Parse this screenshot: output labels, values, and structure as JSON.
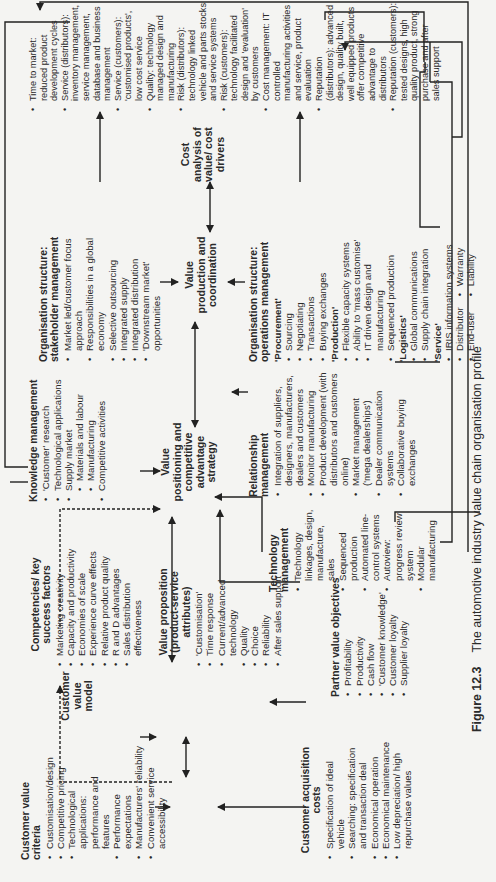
{
  "figure": {
    "number": "Figure 12.3",
    "caption": "The automotive industry value chain organisation profile"
  },
  "customer_value_criteria": {
    "title": "Customer value criteria",
    "items": [
      "Customisation/design",
      "Competitive pricing",
      "Technological applications: performance and features",
      "Performance expectations",
      "Manufacturers' reliability",
      "Convenient service accessibility"
    ]
  },
  "customer_value_model": {
    "label": "Customer value model"
  },
  "customer_acquisition_costs": {
    "title": "Customer acquisition costs",
    "items": [
      "Specification of ideal vehicle",
      "Searching: specification and transaction deal",
      "Economical operation",
      "Economical maintenance",
      "Low depreciation/ high repurchase values"
    ]
  },
  "competencies": {
    "title": "Competencies/ key success factors",
    "items": [
      "Marketing creativity",
      "Capacity and productivity",
      "Economies of scale",
      "Experience curve effects",
      "Relative product quality",
      "R and D advantages",
      "Sales distribution effectiveness"
    ]
  },
  "value_proposition": {
    "title": "Value proposition (product-service attributes)",
    "items": [
      "'Customisation'",
      "Time response",
      "Current/advanced technology",
      "Quality",
      "Choice",
      "Reliability",
      "After sales support"
    ]
  },
  "partner_value_objectives": {
    "title": "Partner value objectives",
    "items": [
      "Profitability",
      "Productivity",
      "Cash flow",
      "'Customer knowledge'",
      "Customer loyalty",
      "Supplier loyalty"
    ]
  },
  "knowledge_management": {
    "title": "Knowledge management",
    "items": [
      {
        "text": "'Customer' research",
        "level": 0
      },
      {
        "text": "Technological applications",
        "level": 0
      },
      {
        "text": "Supply market",
        "level": 0
      },
      {
        "text": "Materials and labour",
        "level": 1
      },
      {
        "text": "Manufacturing",
        "level": 1
      },
      {
        "text": "Competitive activities",
        "level": 0
      }
    ]
  },
  "value_positioning": {
    "label": "Value positioning and competitive advantage strategy"
  },
  "technology_management": {
    "title": "Technology management",
    "items": [
      "Technology linkages, design, manufacture, sales",
      "Sequenced production",
      "Automated line-control systems",
      "Autoview: progress review system",
      "Modular manufacturing"
    ]
  },
  "relationship_management": {
    "title": "Relationship management",
    "items": [
      "Integration of suppliers, designers, manufacturers, dealers and customers",
      "Monitor manufacturing",
      "Product development (with distributors and customers online)",
      "Market management ('mega dealerships')",
      "Dealer communication systems",
      "Collaborative buying exchanges"
    ]
  },
  "stakeholder_management": {
    "title": "Organisation structure: stakeholder management",
    "items": [
      "Market led/customer focus approach",
      "Responsibilities in a global economy",
      "Selective outsourcing",
      "Integrated supply",
      "Integrated distribution",
      "'Downstream market' opportunities"
    ]
  },
  "value_production": {
    "label": "Value production and coordination"
  },
  "operations_management": {
    "title": "Organisation structure: operations management",
    "sections": [
      {
        "heading": "'Procurement'",
        "items": [
          "Sourcing",
          "Negotiating",
          "Transactions",
          "Buying exchanges"
        ]
      },
      {
        "heading": "'Production'",
        "items": [
          "Flexible capacity systems",
          "Ability to 'mass customise'",
          "IT driven design and manufacturing",
          "Sequenced production"
        ]
      },
      {
        "heading": "'Logistics'",
        "items": [
          "Global communications",
          "Supply chain integration"
        ]
      },
      {
        "heading": "'Service'",
        "items": [
          "IRIS information systems"
        ],
        "columns": [
          [
            "Distributor",
            "End-user"
          ],
          [
            "Warranty",
            "Liability"
          ]
        ]
      }
    ]
  },
  "cost_analysis": {
    "label": "Cost analysis of value/ cost drivers"
  },
  "outcomes": {
    "items": [
      "Time to market: reduced product development cycles",
      "Service (distributors): inventory management, service management, database and business management",
      "Service (customers): 'customised products', low cost service",
      "Quality: technology managed design and manufacturing",
      "Risk (distributors): technology linked vehicle and parts stocks and service systems",
      "Risk (customers): technology facilitated design and 'evaluation' by customers",
      "Cost management: IT controlled manufacturing activities and service, product evaluation",
      "Reputation (distributors): advanced design, quality built, well equipped products offer competitive advantage to distributors",
      "Reputation (customers): tested designs, high quality product, strong purchase and after sales support"
    ]
  }
}
